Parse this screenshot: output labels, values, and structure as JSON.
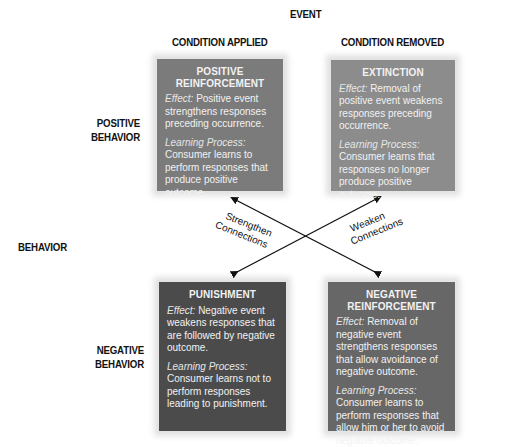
{
  "header": {
    "event": "EVENT",
    "col_applied": "CONDITION APPLIED",
    "col_removed": "CONDITION REMOVED"
  },
  "rows": {
    "positive": [
      "POSITIVE",
      "BEHAVIOR"
    ],
    "behavior": "BEHAVIOR",
    "negative": [
      "NEGATIVE",
      "BEHAVIOR"
    ]
  },
  "boxes": {
    "positive_reinforcement": {
      "title": [
        "POSITIVE",
        "REINFORCEMENT"
      ],
      "effect_label": "Effect:",
      "effect_text": "Positive event strengthens responses preceding occurrence.",
      "learning_label": "Learning Process:",
      "learning_text": "Consumer learns to perform responses that produce positive outcome.",
      "color": "#7b7b7b"
    },
    "extinction": {
      "title": [
        "EXTINCTION"
      ],
      "effect_label": "Effect:",
      "effect_text": "Removal of positive event weakens responses preceding occurrence.",
      "learning_label": "Learning Process:",
      "learning_text": "Consumer learns that responses no longer produce positive outcome.",
      "color": "#8c8c8c"
    },
    "punishment": {
      "title": [
        "PUNISHMENT"
      ],
      "effect_label": "Effect:",
      "effect_text": "Negative event weakens responses that are followed by negative outcome.",
      "learning_label": "Learning Process:",
      "learning_text": "Consumer learns not to perform responses leading to punishment.",
      "color": "#4b4b4b"
    },
    "negative_reinforcement": {
      "title": [
        "NEGATIVE",
        "REINFORCEMENT"
      ],
      "effect_label": "Effect:",
      "effect_text": "Removal of negative event strengthens responses that allow avoidance of negative outcome.",
      "learning_label": "Learning Process:",
      "learning_text": "Consumer learns to perform responses that allow him or her to avoid negative outcome.",
      "color": "#676767"
    }
  },
  "connections": {
    "strengthen": [
      "Strengthen",
      "Connections"
    ],
    "weaken": [
      "Weaken",
      "Connections"
    ]
  }
}
